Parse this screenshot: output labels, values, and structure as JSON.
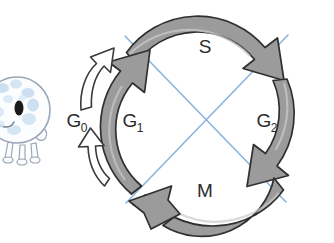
{
  "figure": {
    "kind": "diagram"
  },
  "cycle": {
    "phases": [
      {
        "id": "s",
        "label": "S",
        "subscript": "",
        "description": "S phase arc, top, clockwise arrow"
      },
      {
        "id": "g2",
        "label": "G",
        "subscript": "2",
        "description": "G2 phase arc, right, clockwise arrow"
      },
      {
        "id": "m",
        "label": "M",
        "subscript": "",
        "description": "M phase arc, bottom, clockwise arrow"
      },
      {
        "id": "g1",
        "label": "G",
        "subscript": "1",
        "description": "G1 phase arc, left, clockwise arrow"
      },
      {
        "id": "g0",
        "label": "G",
        "subscript": "0",
        "description": "G0 quiescent state, outside the cycle, double white arrow"
      }
    ]
  },
  "mascot": {
    "name": "cell-character",
    "description": "smiling cartoon cell mascot with pale blue spots and small legs"
  },
  "colors": {
    "arc_fill": "#9b9b9b",
    "arc_fill_light": "#b4b4b4",
    "arc_stroke": "#2f2f2f",
    "white_arrow_fill": "#ffffff",
    "white_arrow_stroke": "#3a3a3a",
    "diagonal_line": "#8ab4de",
    "label_text": "#2b2b2b",
    "mascot_body": "#fbfdff",
    "mascot_outline": "#9aa7b4",
    "mascot_spots": "#c6dcef",
    "mascot_eye": "#1a1a1a",
    "background": "#ffffff"
  }
}
